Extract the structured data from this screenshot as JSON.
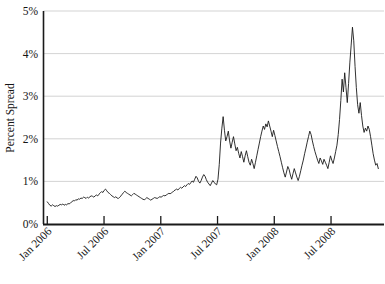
{
  "chart_data": {
    "type": "line",
    "title": "",
    "subtitle": "",
    "xlabel": "",
    "ylabel": "Percent Spread",
    "ylim": [
      0,
      5
    ],
    "ytick_labels": [
      "0%",
      "1%",
      "2%",
      "3%",
      "4%",
      "5%"
    ],
    "ytick_values": [
      0,
      1,
      2,
      3,
      4,
      5
    ],
    "xtick_labels": [
      "Jan 2006",
      "Jul 2006",
      "Jan 2007",
      "Jul 2007",
      "Jan 2008",
      "Jul 2008"
    ],
    "xtick_values": [
      0,
      6,
      12,
      18,
      24,
      30
    ],
    "xlim": [
      -0.4,
      35.6
    ],
    "grid": "horizontal",
    "legend": "none",
    "line_color": "#1a1a1a",
    "grid_color": "#c8c8c8",
    "axis_color": "#1a1a1a",
    "series": [
      {
        "name": "Percent Spread",
        "x_unit": "months since Jan 2006",
        "values": [
          0.52,
          0.48,
          0.44,
          0.42,
          0.45,
          0.43,
          0.41,
          0.43,
          0.42,
          0.44,
          0.46,
          0.45,
          0.47,
          0.44,
          0.46,
          0.45,
          0.48,
          0.47,
          0.5,
          0.52,
          0.55,
          0.54,
          0.57,
          0.56,
          0.59,
          0.58,
          0.61,
          0.6,
          0.63,
          0.62,
          0.6,
          0.63,
          0.61,
          0.64,
          0.66,
          0.65,
          0.63,
          0.66,
          0.68,
          0.66,
          0.7,
          0.73,
          0.76,
          0.74,
          0.79,
          0.82,
          0.78,
          0.74,
          0.72,
          0.69,
          0.66,
          0.64,
          0.62,
          0.64,
          0.61,
          0.6,
          0.63,
          0.66,
          0.7,
          0.74,
          0.77,
          0.74,
          0.72,
          0.7,
          0.68,
          0.66,
          0.69,
          0.72,
          0.7,
          0.68,
          0.66,
          0.64,
          0.62,
          0.6,
          0.58,
          0.57,
          0.59,
          0.62,
          0.6,
          0.58,
          0.56,
          0.58,
          0.6,
          0.62,
          0.61,
          0.6,
          0.62,
          0.64,
          0.63,
          0.65,
          0.67,
          0.66,
          0.68,
          0.7,
          0.72,
          0.71,
          0.73,
          0.75,
          0.78,
          0.8,
          0.82,
          0.8,
          0.83,
          0.86,
          0.84,
          0.87,
          0.9,
          0.88,
          0.92,
          0.95,
          0.93,
          0.97,
          1.01,
          0.98,
          1.05,
          1.12,
          1.08,
          1.0,
          0.96,
          1.02,
          1.1,
          1.16,
          1.12,
          1.04,
          0.98,
          0.94,
          0.9,
          0.96,
          1.02,
          0.98,
          0.94,
          0.92,
          1.05,
          1.4,
          1.9,
          2.25,
          2.52,
          2.2,
          1.95,
          2.05,
          2.18,
          1.95,
          1.78,
          1.92,
          2.05,
          1.88,
          1.72,
          1.8,
          1.66,
          1.55,
          1.7,
          1.58,
          1.45,
          1.6,
          1.72,
          1.58,
          1.45,
          1.38,
          1.52,
          1.42,
          1.3,
          1.45,
          1.6,
          1.75,
          1.9,
          2.05,
          2.18,
          2.3,
          2.22,
          2.35,
          2.28,
          2.42,
          2.3,
          2.18,
          2.05,
          2.2,
          2.08,
          1.95,
          1.82,
          1.7,
          1.58,
          1.45,
          1.32,
          1.2,
          1.1,
          1.22,
          1.35,
          1.28,
          1.15,
          1.05,
          1.18,
          1.3,
          1.2,
          1.1,
          1.02,
          1.12,
          1.25,
          1.38,
          1.5,
          1.65,
          1.78,
          1.92,
          2.05,
          2.18,
          2.1,
          1.95,
          1.82,
          1.7,
          1.6,
          1.5,
          1.42,
          1.55,
          1.48,
          1.4,
          1.52,
          1.45,
          1.38,
          1.3,
          1.45,
          1.6,
          1.5,
          1.42,
          1.55,
          1.7,
          1.85,
          2.1,
          2.45,
          2.9,
          3.4,
          3.1,
          3.55,
          3.2,
          2.85,
          3.3,
          3.8,
          4.2,
          4.62,
          4.3,
          3.7,
          3.2,
          2.8,
          2.6,
          2.85,
          2.55,
          2.3,
          2.15,
          2.25,
          2.18,
          2.3,
          2.22,
          2.05,
          1.85,
          1.65,
          1.5,
          1.38,
          1.42,
          1.3
        ]
      }
    ]
  }
}
